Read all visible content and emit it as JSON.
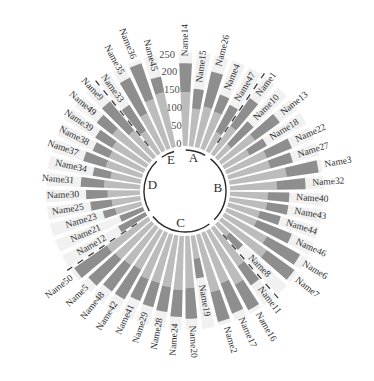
{
  "chart_data": {
    "type": "bar",
    "subtype": "polar-stacked-radial",
    "title": "",
    "legend": "none",
    "grid": "off",
    "ylim": [
      0,
      250
    ],
    "radial_axis": {
      "ticks": [
        0,
        50,
        100,
        150,
        200,
        250
      ],
      "max": 250,
      "tick_angle_deg": -7.5,
      "tick_color": "#4d4d4d"
    },
    "series": [
      {
        "name": "inner-segment",
        "color": "#bcbcbc"
      },
      {
        "name": "outer-segment",
        "color": "#8e8e8e"
      }
    ],
    "background_wedge_color": "#f1f1f1",
    "divider_color": "#3a3a3a",
    "ring_color": "#2a2a2a",
    "label_color": "#2e2e2e",
    "group_letter_color": "#2e2e2e",
    "divider_angles_deg": [
      34,
      139,
      236,
      321
    ],
    "groups": [
      {
        "label": "A",
        "letter_angle_deg": 15,
        "start_deg": -3.5,
        "end_deg": 34,
        "bars": [
          {
            "label": "Name14",
            "values": [
              150,
              80
            ]
          },
          {
            "label": "Name15",
            "values": [
              105,
              55
            ]
          },
          {
            "label": "Name26",
            "values": [
              115,
              100
            ]
          },
          {
            "label": "Name4",
            "values": [
              110,
              50
            ]
          },
          {
            "label": "Name47",
            "values": [
              60,
              85
            ]
          }
        ]
      },
      {
        "label": "B",
        "letter_angle_deg": 86.5,
        "start_deg": 34,
        "end_deg": 139,
        "bars": [
          {
            "label": "Name1",
            "values": [
              95,
              95
            ]
          },
          {
            "label": "Name10",
            "values": [
              50,
              85
            ]
          },
          {
            "label": "Name13",
            "values": [
              115,
              85
            ]
          },
          {
            "label": "Name18",
            "values": [
              80,
              55
            ]
          },
          {
            "label": "Name22",
            "values": [
              120,
              75
            ]
          },
          {
            "label": "Name27",
            "values": [
              120,
              65
            ]
          },
          {
            "label": "Name3",
            "values": [
              160,
              90
            ]
          },
          {
            "label": "Name32",
            "values": [
              130,
              80
            ]
          },
          {
            "label": "Name40",
            "values": [
              105,
              60
            ]
          },
          {
            "label": "Name43",
            "values": [
              105,
              60
            ]
          },
          {
            "label": "Name44",
            "values": [
              90,
              60
            ]
          },
          {
            "label": "Name46",
            "values": [
              90,
              105
            ]
          },
          {
            "label": "Name6",
            "values": [
              135,
              105
            ]
          },
          {
            "label": "Name7",
            "values": [
              155,
              95
            ]
          },
          {
            "label": "Name8",
            "values": [
              45,
              50
            ]
          }
        ]
      },
      {
        "label": "C",
        "letter_angle_deg": 187.5,
        "start_deg": 139,
        "end_deg": 236,
        "bars": [
          {
            "label": "Name11",
            "values": [
              130,
              65
            ]
          },
          {
            "label": "Name16",
            "values": [
              170,
              80
            ]
          },
          {
            "label": "Name17",
            "values": [
              150,
              90
            ]
          },
          {
            "label": "Name2",
            "values": [
              165,
              85
            ]
          },
          {
            "label": "Name19",
            "values": [
              65,
              55
            ]
          },
          {
            "label": "Name20",
            "values": [
              145,
              85
            ]
          },
          {
            "label": "Name24",
            "values": [
              150,
              75
            ]
          },
          {
            "label": "Name28",
            "values": [
              145,
              70
            ]
          },
          {
            "label": "Name29",
            "values": [
              140,
              70
            ]
          },
          {
            "label": "Name41",
            "values": [
              140,
              65
            ]
          },
          {
            "label": "Name42",
            "values": [
              125,
              95
            ]
          },
          {
            "label": "Name48",
            "values": [
              130,
              90
            ]
          },
          {
            "label": "Name5",
            "values": [
              135,
              100
            ]
          },
          {
            "label": "Name50",
            "values": [
              140,
              110
            ]
          }
        ]
      },
      {
        "label": "D",
        "letter_angle_deg": 278.5,
        "start_deg": 236,
        "end_deg": 321,
        "bars": [
          {
            "label": "Name12",
            "values": [
              0,
              85
            ]
          },
          {
            "label": "Name21",
            "values": [
              0,
              70
            ]
          },
          {
            "label": "Name23",
            "values": [
              75,
              35
            ]
          },
          {
            "label": "Name25",
            "values": [
              80,
              60
            ]
          },
          {
            "label": "Name30",
            "values": [
              90,
              60
            ]
          },
          {
            "label": "Name31",
            "values": [
              100,
              65
            ]
          },
          {
            "label": "Name34",
            "values": [
              85,
              50
            ]
          },
          {
            "label": "Name37",
            "values": [
              105,
              65
            ]
          },
          {
            "label": "Name38",
            "values": [
              105,
              50
            ]
          },
          {
            "label": "Name39",
            "values": [
              110,
              55
            ]
          },
          {
            "label": "Name49",
            "values": [
              130,
              55
            ]
          },
          {
            "label": "Name9",
            "values": [
              95,
              105
            ]
          }
        ]
      },
      {
        "label": "E",
        "letter_angle_deg": 335,
        "start_deg": 321,
        "end_deg": 349,
        "bars": [
          {
            "label": "Name33",
            "values": [
              75,
              85
            ]
          },
          {
            "label": "Name35",
            "values": [
              115,
              110
            ]
          },
          {
            "label": "Name36",
            "values": [
              145,
              105
            ]
          },
          {
            "label": "Name45",
            "values": [
              155,
              45
            ]
          }
        ]
      }
    ]
  }
}
